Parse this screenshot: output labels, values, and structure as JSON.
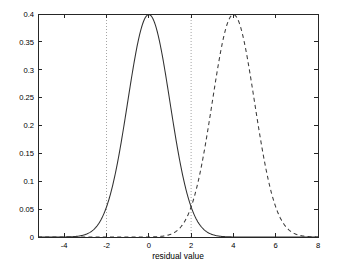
{
  "figure": {
    "background_color": "#ffffff",
    "axis_color": "#262626",
    "gridline_color": "#8c8c8c"
  },
  "chart_data": {
    "type": "line",
    "title": "",
    "subtitle": "",
    "xlabel": "residual value",
    "ylabel": "",
    "xlim": [
      -5.24,
      8
    ],
    "ylim": [
      0,
      0.4
    ],
    "xticks": [
      -4,
      -2,
      0,
      2,
      4,
      6,
      8
    ],
    "xtick_labels": [
      "-4",
      "-2",
      "0",
      "2",
      "4",
      "6",
      "8"
    ],
    "yticks": [
      0,
      0.05,
      0.1,
      0.15,
      0.2,
      0.25,
      0.3,
      0.35,
      0.4
    ],
    "ytick_labels": [
      "0",
      "0.05",
      "0.1",
      "0.15",
      "0.2",
      "0.25",
      "0.3",
      "0.35",
      "0.4"
    ],
    "grid": false,
    "legend": null,
    "legend_position": "none",
    "vertical_reference_lines": [
      {
        "x": -2,
        "style": "dotted",
        "color": "#8c8c8c"
      },
      {
        "x": 2,
        "style": "dotted",
        "color": "#8c8c8c"
      }
    ],
    "annotations": [],
    "series": [
      {
        "name": "null distribution",
        "style": "solid",
        "color": "#303030",
        "distribution": "normal",
        "mean": 0,
        "sd": 1,
        "peak_value": 0.3989,
        "x": [
          -5.24,
          -5,
          -4.5,
          -4,
          -3.5,
          -3,
          -2.5,
          -2,
          -1.5,
          -1,
          -0.5,
          0,
          0.5,
          1,
          1.5,
          2,
          2.5,
          3,
          3.5,
          4,
          4.5,
          5,
          5.5,
          6,
          6.5,
          7,
          7.5,
          8
        ],
        "values": [
          0.0,
          0.0,
          0.0,
          0.0001,
          0.0009,
          0.0044,
          0.0175,
          0.054,
          0.1295,
          0.242,
          0.3521,
          0.3989,
          0.3521,
          0.242,
          0.1295,
          0.054,
          0.0175,
          0.0044,
          0.0009,
          0.0001,
          0.0,
          0.0,
          0.0,
          0.0,
          0.0,
          0.0,
          0.0,
          0.0
        ]
      },
      {
        "name": "alternative distribution",
        "style": "dashed",
        "color": "#3a3a3a",
        "distribution": "normal",
        "mean": 4,
        "sd": 1,
        "peak_value": 0.3989,
        "x": [
          -5.24,
          -5,
          -4.5,
          -4,
          -3.5,
          -3,
          -2.5,
          -2,
          -1.5,
          -1,
          -0.5,
          0,
          0.5,
          1,
          1.5,
          2,
          2.5,
          3,
          3.5,
          4,
          4.5,
          5,
          5.5,
          6,
          6.5,
          7,
          7.5,
          8
        ],
        "values": [
          0.0,
          0.0,
          0.0,
          0.0,
          0.0,
          0.0,
          0.0,
          0.0,
          0.0,
          0.0,
          0.0,
          0.0001,
          0.0009,
          0.0044,
          0.0175,
          0.054,
          0.1295,
          0.242,
          0.3521,
          0.3989,
          0.3521,
          0.242,
          0.1295,
          0.054,
          0.0175,
          0.0044,
          0.0009,
          0.0001
        ]
      }
    ]
  }
}
